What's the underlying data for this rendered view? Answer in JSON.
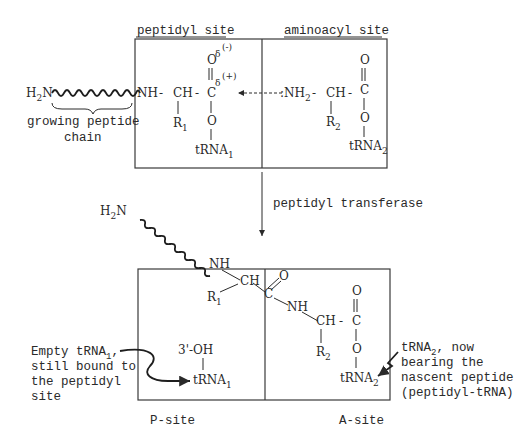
{
  "top_panel": {
    "peptidyl_site_label": "peptidyl site",
    "aminoacyl_site_label": "aminoacyl site",
    "chain_start": "H",
    "chain_start_sub": "2",
    "chain_start_end": "N",
    "growing_chain_label_line1": "growing peptide",
    "growing_chain_label_line2": "chain",
    "peptidyl": {
      "nh": "NH",
      "ch": "CH",
      "r": "R",
      "r_sub": "1",
      "c": "C",
      "o_top": "O",
      "o_ester": "O",
      "delta_minus": "δ",
      "minus_charge": "(-)",
      "delta_plus": "δ",
      "plus_charge": "(+)",
      "trna": "tRNA",
      "trna_sub": "1",
      "dash": "-"
    },
    "aminoacyl": {
      "nh2": ":NH",
      "nh2_sub": "2",
      "ch": "CH",
      "r": "R",
      "r_sub": "2",
      "c": "C",
      "o_top": "O",
      "o_ester": "O",
      "trna": "tRNA",
      "trna_sub": "2",
      "dash": "-"
    }
  },
  "transition": {
    "enzyme_label": "peptidyl transferase"
  },
  "bottom_panel": {
    "chain_start": "H",
    "chain_start_sub": "2",
    "chain_start_end": "N",
    "nh_1": "NH",
    "ch_1": "CH",
    "r1": "R",
    "r1_sub": "1",
    "c_peptide": "C",
    "o_peptide": "O",
    "nh_2": "NH",
    "ch_2": "CH",
    "r2": "R",
    "r2_sub": "2",
    "c_ester": "C",
    "o_top": "O",
    "o_ester": "O",
    "dash": "-",
    "oh": "3'-OH",
    "trna1": "tRNA",
    "trna1_sub": "1",
    "trna2": "tRNA",
    "trna2_sub": "2",
    "p_site_label": "P-site",
    "a_site_label": "A-site",
    "left_annotation": {
      "line1_a": "Empty tRNA",
      "line1_sub": "1",
      "line1_b": ",",
      "line2": "still bound to",
      "line3": "the peptidyl",
      "line4": "site"
    },
    "right_annotation": {
      "line1_a": "tRNA",
      "line1_sub": "2",
      "line1_b": ", now",
      "line2": "bearing the",
      "line3": "nascent peptide",
      "line4": "(peptidyl-tRNA)"
    }
  }
}
